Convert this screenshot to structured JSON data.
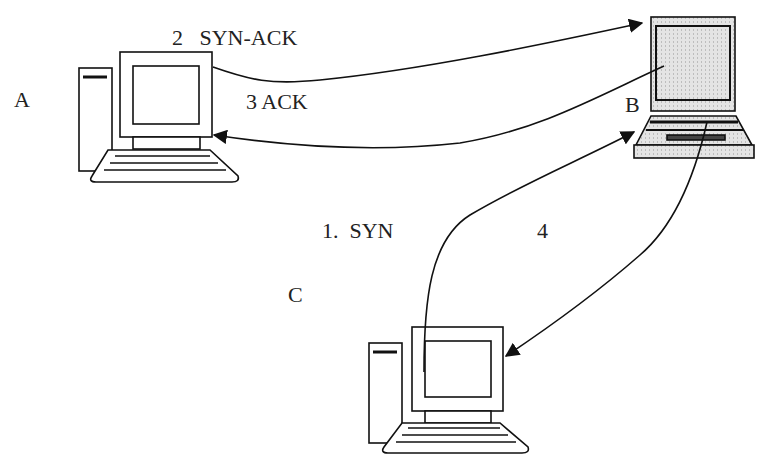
{
  "diagram": {
    "nodes": [
      {
        "id": "A",
        "label": "A",
        "type": "desktop-computer"
      },
      {
        "id": "B",
        "label": "B",
        "type": "laptop-computer"
      },
      {
        "id": "C",
        "label": "C",
        "type": "desktop-computer"
      }
    ],
    "edges": [
      {
        "from": "C",
        "to": "B",
        "label": "1.  SYN"
      },
      {
        "from": "A",
        "to": "B",
        "label": "2   SYN-ACK"
      },
      {
        "from": "B",
        "to": "A",
        "label": "3 ACK"
      },
      {
        "from": "B",
        "to": "C",
        "label": "4"
      }
    ]
  },
  "colors": {
    "line": "#111111",
    "background": "#ffffff",
    "laptop_fill": "#dcdcdc"
  }
}
